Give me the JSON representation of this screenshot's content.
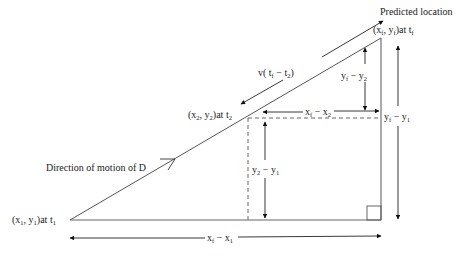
{
  "diagram": {
    "title": "Predicted location",
    "points": {
      "start": {
        "label": "(x",
        "sub1": "1",
        "mid": ", y",
        "sub2": "1",
        "end": ")at t",
        "sub3": "1"
      },
      "mid": {
        "label": "(x",
        "sub1": "2",
        "mid": ", y",
        "sub2": "2",
        "end": ")at t",
        "sub3": "2"
      },
      "final": {
        "label": "(x",
        "sub1": "f",
        "mid": ", y",
        "sub2": "f",
        "end": ")at t",
        "sub3": "f"
      }
    },
    "direction_label": "Direction of motion of D",
    "velocity_label": {
      "pre": "v( t",
      "sub1": "f",
      "mid": " − t",
      "sub2": "2",
      "post": ")"
    },
    "dims": {
      "yf_y2": {
        "a": "y",
        "asub": "f",
        "op": " − ",
        "b": "y",
        "bsub": "2"
      },
      "xf_x2": {
        "a": "x",
        "asub": "f",
        "op": " − ",
        "b": "x",
        "bsub": "2"
      },
      "yf_y1": {
        "a": "y",
        "asub": "f",
        "op": " − ",
        "b": "y",
        "bsub": "1"
      },
      "y2_y1": {
        "a": "y",
        "asub": "2",
        "op": " − ",
        "b": "y",
        "bsub": "1"
      },
      "xf_x1": {
        "a": "x",
        "asub": "f",
        "op": " − ",
        "b": "x",
        "bsub": "1"
      }
    },
    "colors": {
      "line": "#444444",
      "text": "#222222",
      "dash": "#555555"
    }
  }
}
